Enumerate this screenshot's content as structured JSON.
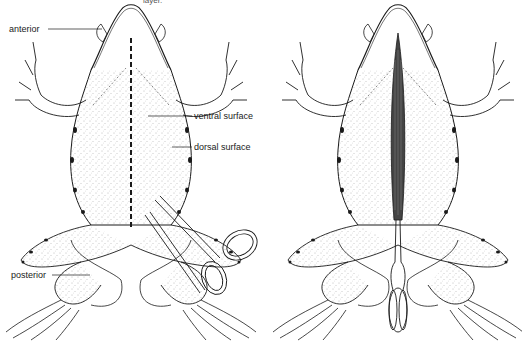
{
  "figure": {
    "clipped_caption": "layer.",
    "left_panel": {
      "title": "Ventral view with incision line and scissors",
      "labels": {
        "anterior": "anterior",
        "ventral_surface": "ventral surface",
        "dorsal_surface": "dorsal surface",
        "posterior": "posterior"
      },
      "instrument": "scissors"
    },
    "right_panel": {
      "title": "Ventral view with opened midline incision and forceps",
      "instrument": "forceps"
    },
    "colors": {
      "ink": "#1a1a1a",
      "stipple": "#555555",
      "background": "#ffffff"
    }
  }
}
